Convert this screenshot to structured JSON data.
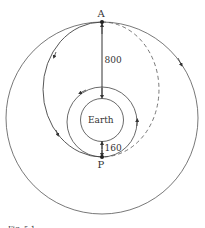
{
  "diagram": {
    "type": "orbital-transfer",
    "labels": {
      "apogee": "A",
      "perigee": "P",
      "earth": "Earth",
      "apogee_distance": "800",
      "perigee_distance": "160"
    },
    "caption": "Fig. 5.1",
    "colors": {
      "line": "#444444",
      "background": "#ffffff"
    },
    "elements": [
      {
        "name": "outer-circular-orbit",
        "style": "solid",
        "direction": "clockwise"
      },
      {
        "name": "transfer-ellipse",
        "style": "solid-left-dashed-right",
        "direction": "counterclockwise"
      },
      {
        "name": "inner-circular-orbit",
        "style": "solid",
        "direction": "counterclockwise"
      },
      {
        "name": "earth",
        "style": "solid"
      }
    ]
  }
}
